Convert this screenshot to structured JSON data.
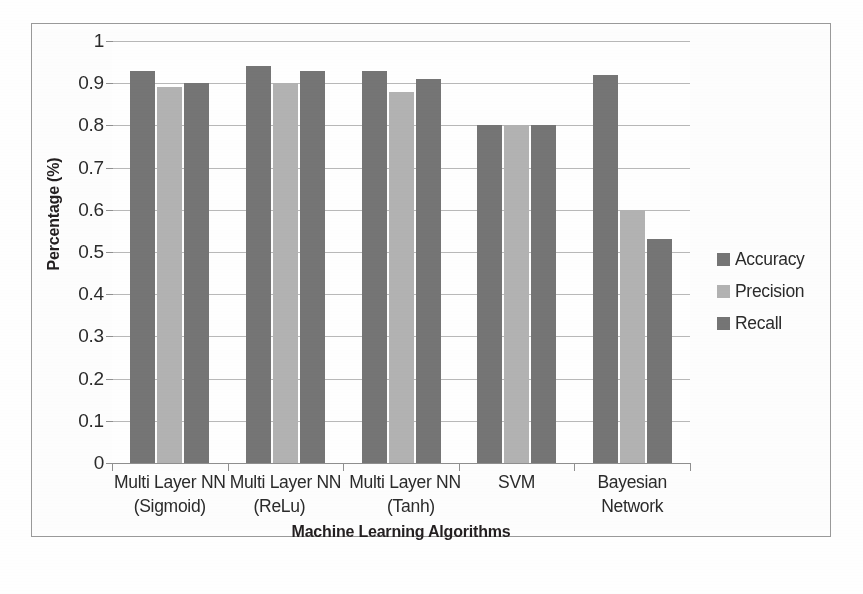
{
  "chart_data": {
    "type": "bar",
    "title": "",
    "xlabel": "Machine Learning Algorithms",
    "ylabel": "Percentage (%)",
    "categories": [
      "Multi Layer NN (Sigmoid)",
      "Multi Layer NN (ReLu)",
      "Multi Layer NN (Tanh)",
      "SVM",
      "Bayesian Network"
    ],
    "category_lines": [
      [
        "Multi Layer NN",
        "(Sigmoid)"
      ],
      [
        "Multi Layer NN",
        "(ReLu)"
      ],
      [
        "Multi Layer NN",
        "(Tanh)"
      ],
      [
        "SVM",
        ""
      ],
      [
        "Bayesian",
        "Network"
      ]
    ],
    "series": [
      {
        "name": "Accuracy",
        "color": "#757575",
        "values": [
          0.93,
          0.94,
          0.93,
          0.8,
          0.92
        ]
      },
      {
        "name": "Precision",
        "color": "#b3b3b3",
        "values": [
          0.89,
          0.9,
          0.88,
          0.8,
          0.6
        ]
      },
      {
        "name": "Recall",
        "color": "#757575",
        "values": [
          0.9,
          0.93,
          0.91,
          0.8,
          0.53
        ]
      }
    ],
    "ylim": [
      0,
      1
    ],
    "yticks": [
      0,
      0.1,
      0.2,
      0.3,
      0.4,
      0.5,
      0.6,
      0.7,
      0.8,
      0.9,
      1
    ],
    "ytick_labels": [
      "0",
      "0.1",
      "0.2",
      "0.3",
      "0.4",
      "0.5",
      "0.6",
      "0.7",
      "0.8",
      "0.9",
      "1"
    ],
    "grid": true,
    "legend_position": "right",
    "legend_entries": [
      "Accuracy",
      "Precision",
      "Recall"
    ]
  },
  "figure": {
    "border_color": "#9a9a9a",
    "background": "#ffffff",
    "axis_color": "#8f8f8f",
    "gridline_color": "#b9b9b9"
  }
}
